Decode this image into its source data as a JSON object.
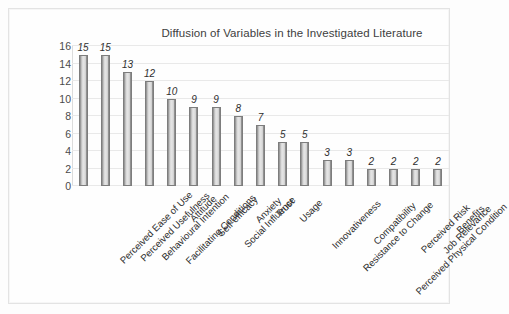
{
  "figure": {
    "title": "Diffusion of Variables in the Investigated Literature"
  },
  "axis": {
    "y_ticks": [
      "16",
      "14",
      "12",
      "10",
      "8",
      "6",
      "4",
      "2",
      "0"
    ]
  },
  "colors": {
    "bar_fill_light": "#e6e6e6",
    "bar_fill_dark": "#8f8f8f",
    "bar_border": "#7d7d7d",
    "gridline": "#e9e9e9",
    "frame_border": "#e3e3e3",
    "text": "#3a3a3a",
    "background": "#fdfdfd"
  },
  "chart_data": {
    "type": "bar",
    "title": "Diffusion of Variables in the Investigated Literature",
    "xlabel": "",
    "ylabel": "",
    "ylim": [
      0,
      16
    ],
    "ytick_step": 2,
    "grid": true,
    "legend": false,
    "data_labels": true,
    "categories": [
      "Perceived Ease of Use",
      "Perceived Usefulness",
      "Behavioural Intention",
      "Facilitating Conditions",
      "Attitude",
      "Self-efficacy",
      "Social Influence",
      "Anxiety",
      "Trust",
      "Usage",
      "Innovativeness",
      "Resistance to Change",
      "Compatibility",
      "Perceived Physical Condition",
      "Perceived Risk",
      "Job Relevance",
      "Benefits"
    ],
    "values": [
      15,
      15,
      13,
      12,
      10,
      9,
      9,
      8,
      7,
      5,
      5,
      3,
      3,
      2,
      2,
      2,
      2
    ]
  }
}
